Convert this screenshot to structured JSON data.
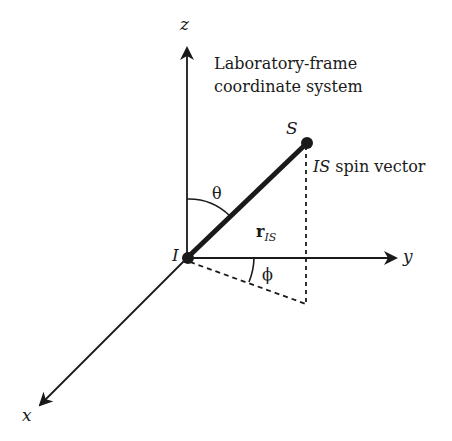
{
  "title": "Laboratory-frame coordinate system",
  "title_lines": [
    "Laboratory-frame",
    "coordinate system"
  ],
  "axes": {
    "x": "x",
    "y": "y",
    "z": "z"
  },
  "points": {
    "origin": "I",
    "end": "S"
  },
  "vector_label_main": "r",
  "vector_label_sub": "IS",
  "spin_label_italic": "IS",
  "spin_label_rest": " spin vector",
  "angles": {
    "polar": "θ",
    "azimuthal": "ϕ"
  },
  "colors": {
    "ink": "#1a1a1a",
    "background": "#ffffff"
  }
}
